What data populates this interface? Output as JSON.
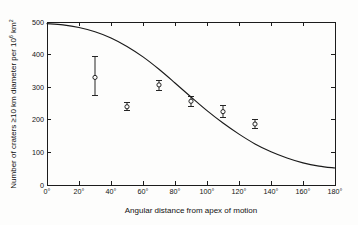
{
  "chart_data": {
    "type": "scatter",
    "title": "",
    "xlabel": "Angular distance from apex of motion",
    "ylabel": "Number of craters ≥10 km diameter per 10⁶ km²",
    "ylabel_parts": {
      "pre": "Number of craters ≥10 km diameter per 10",
      "exp1": "6",
      "mid": " km",
      "exp2": "2"
    },
    "xlim": [
      0,
      180
    ],
    "ylim": [
      0,
      500
    ],
    "grid": false,
    "legend": null,
    "xticks": [
      0,
      20,
      40,
      60,
      80,
      100,
      120,
      140,
      160,
      180
    ],
    "xticklabels": [
      "0°",
      "20°",
      "40°",
      "60°",
      "80°",
      "100°",
      "120°",
      "140°",
      "160°",
      "180°"
    ],
    "yticks": [
      0,
      100,
      200,
      300,
      400,
      500
    ],
    "yticklabels": [
      "0",
      "100",
      "200",
      "300",
      "400",
      "500"
    ],
    "series": [
      {
        "name": "Observed crater density",
        "type": "scatter",
        "marker": "open-circle",
        "color": "#1a1a1a",
        "x": [
          30,
          50,
          70,
          90,
          110,
          130
        ],
        "values": [
          330,
          240,
          307,
          257,
          225,
          187
        ],
        "yerr_low": [
          275,
          229,
          291,
          241,
          208,
          173
        ],
        "yerr_high": [
          395,
          252,
          322,
          273,
          243,
          201
        ]
      },
      {
        "name": "Model curve",
        "type": "line",
        "color": "#1a1a1a",
        "x": [
          0,
          10,
          20,
          30,
          40,
          50,
          60,
          70,
          80,
          90,
          100,
          110,
          120,
          130,
          140,
          150,
          160,
          170,
          180
        ],
        "values": [
          495,
          491,
          483,
          470,
          451,
          425,
          393,
          355,
          313,
          270,
          228,
          190,
          156,
          126,
          102,
          83,
          68,
          58,
          52
        ]
      }
    ]
  },
  "axes_geometry": {
    "left": 47,
    "right": 335,
    "top": 22,
    "bottom": 185
  }
}
